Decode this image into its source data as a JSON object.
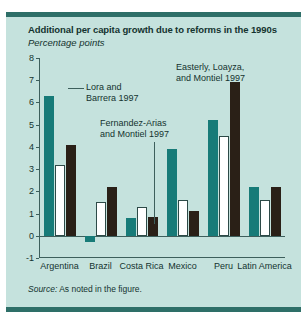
{
  "figure": {
    "title": "Additional per capita growth due to reforms in the 1990s",
    "subtitle": "Percentage points",
    "source_word": "Source:",
    "source_text": " As noted in the figure.",
    "background_color": "#c5e2dd",
    "rule_color": "#2e6f68"
  },
  "annotations": [
    {
      "id": "lora",
      "text": "Lora and\nBarrera 1997"
    },
    {
      "id": "fernandez",
      "text": "Fernandez-Arias\nand Montiel 1997"
    },
    {
      "id": "easterly",
      "text": "Easterly, Loayza,\nand Montiel 1997"
    }
  ],
  "chart_data": {
    "type": "bar",
    "title": "Additional per capita growth due to reforms in the 1990s",
    "subtitle": "Percentage points",
    "xlabel": "",
    "ylabel": "Percentage points",
    "ylim": [
      -1,
      8
    ],
    "yticks": [
      -1,
      0,
      1,
      2,
      3,
      4,
      5,
      6,
      7,
      8
    ],
    "grid": false,
    "legend_position": "annotated-inline",
    "categories": [
      "Argentina",
      "Brazil",
      "Costa Rica",
      "Mexico",
      "Peru",
      "Latin America"
    ],
    "series": [
      {
        "name": "Lora and Barrera 1997",
        "color": "#177b78",
        "values": [
          6.3,
          -0.3,
          0.8,
          3.9,
          5.2,
          2.2
        ]
      },
      {
        "name": "Fernandez-Arias and Montiel 1997",
        "color": "#ffffff",
        "values": [
          3.2,
          1.5,
          1.3,
          1.6,
          4.5,
          1.6
        ]
      },
      {
        "name": "Easterly, Loayza, and Montiel 1997",
        "color": "#2a2017",
        "values": [
          4.1,
          2.2,
          0.85,
          1.1,
          6.9,
          2.2
        ]
      }
    ]
  }
}
